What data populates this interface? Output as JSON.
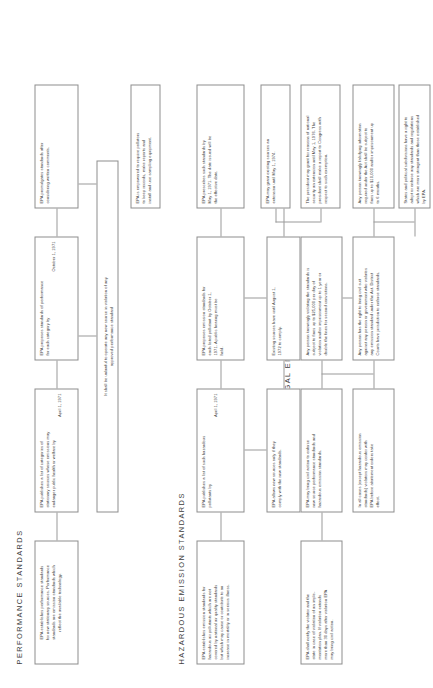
{
  "document": {
    "title": "Air Pollution Control Act Flow Chart",
    "orientation": "landscape-rotated-ccw"
  },
  "sections": [
    {
      "id": "performance-standards",
      "label": "PERFORMANCE   STANDARDS"
    },
    {
      "id": "hazardous-emission-standards",
      "label": "HAZARDOUS   EMISSION   STANDARDS"
    },
    {
      "id": "legal-enforcement",
      "label": "LEGAL   ENFORCEMENT"
    }
  ],
  "nodes": {
    "perf_establishes": {
      "line1": "EPA establishes performance standards",
      "line2": "for new stationary sources.  Performance",
      "line3": "standards are emission standards which",
      "line4": "reflect the available technology."
    },
    "perf_proposes": {
      "line1": "EPA proposes standards of performance",
      "line2": "for each category by",
      "line3": "October 1, 1971"
    },
    "perf_promulgates": {
      "line1": "EPA promulgates standards after",
      "line2": "considering written comments."
    },
    "perf_unlawful": {
      "line1": "It shall be unlawful to operate any new source in violation of any",
      "line2": "approved performance standard"
    },
    "haz_establishes": {
      "line1": "EPA establishes emission standards for",
      "line2": "hazardous air pollutants which are not",
      "line3": "covered by national air quality standards",
      "line4": "but which may cause or contribute to an",
      "line5": "increase in mortality or in serious illness."
    },
    "haz_publishes_categories": {
      "line1": "EPA publishes a list of categories of",
      "line2": "stationary sources whose emissions may",
      "line3": "endanger public health or welfare by",
      "line4": "April 1, 1971"
    },
    "haz_publishes_list": {
      "line1": "EPA publishes a list of such hazardous",
      "line2": "pollutants by",
      "line3": "April 1, 1971"
    },
    "haz_proposes": {
      "line1": "EPA proposes emission standards for",
      "line2": "each listed pollutant by October 1,",
      "line3": "1971.  A public hearing must be",
      "line4": "held."
    },
    "haz_prescribes": {
      "line1": "EPA prescribes such standards by",
      "line2": "May 1, 1971.  The date issued will be",
      "line3": "the effective date."
    },
    "haz_allows_new": {
      "line1": "EPA allows new sources only if they",
      "line2": "comply with the new standards."
    },
    "haz_existing_sources": {
      "line1": "Existing sources have until August 1,",
      "line2": "1972 to comply."
    },
    "haz_extension": {
      "line1": "EPA may grant existing sources an",
      "line2": "extension until May 1, 1974."
    },
    "haz_president": {
      "line1": "The president may grant for reasons of national",
      "line2": "security an extension until May 1, 1976.  The",
      "line3": "president shall make a report to Congress with",
      "line4": "respect to such exemption."
    },
    "enf_notify": {
      "line1": "EPA shall notify the violator and the",
      "line2": "state in case of violation of an imple-",
      "line3": "mentation plan.  If violation extends",
      "line4": "more than 30 days after violation EPA",
      "line5": "may bring civil action."
    },
    "enf_civil_action": {
      "line1": "EPA may bring civil action to enforce",
      "line2": "new source performance standards and",
      "line3": "hazardous emission standards."
    },
    "enf_abatement": {
      "line1": "In all cases (except hazardous emission",
      "line2": "standards) violators may confer with",
      "line3": "EPA before abatement orders take",
      "line4": "effect."
    },
    "enf_knowing_violation": {
      "line1": "Any person knowingly violating the standards is",
      "line2": "subject to fines up to $25,000 per day of",
      "line3": "violation and/or imprisonment up to 1 year or",
      "line4": "double the fines for second convictions."
    },
    "enf_falsifying": {
      "line1": "Any person knowingly falsifying information",
      "line2": "required under the Act shall be subject to",
      "line3": "fines up to $10,000 and/or imprisonment up",
      "line4": "to 6 months."
    },
    "enf_citizen_suit": {
      "line1": "Any person has the right to bring civil suit",
      "line2": "against any person or government who violates",
      "line3": "any emission standard under the Act.  District",
      "line4": "Courts have jurisdiction to enforce standards."
    },
    "enf_states_rights": {
      "line1": "States and political subdivisions have a right to",
      "line2": "adopt or enforce any standards and regulations",
      "line3": "which are more stringent than those established",
      "line4": "by EPA."
    },
    "epa_empowered": {
      "line1": "EPA is empowered to require pollutors",
      "line2": "to keep records, make reports and",
      "line3": "install and use sampling equipment."
    }
  },
  "colors": {
    "box_border": "#8d8d8d",
    "connector": "#9a9a9a",
    "text": "#3a3a3a",
    "background": "#ffffff"
  }
}
